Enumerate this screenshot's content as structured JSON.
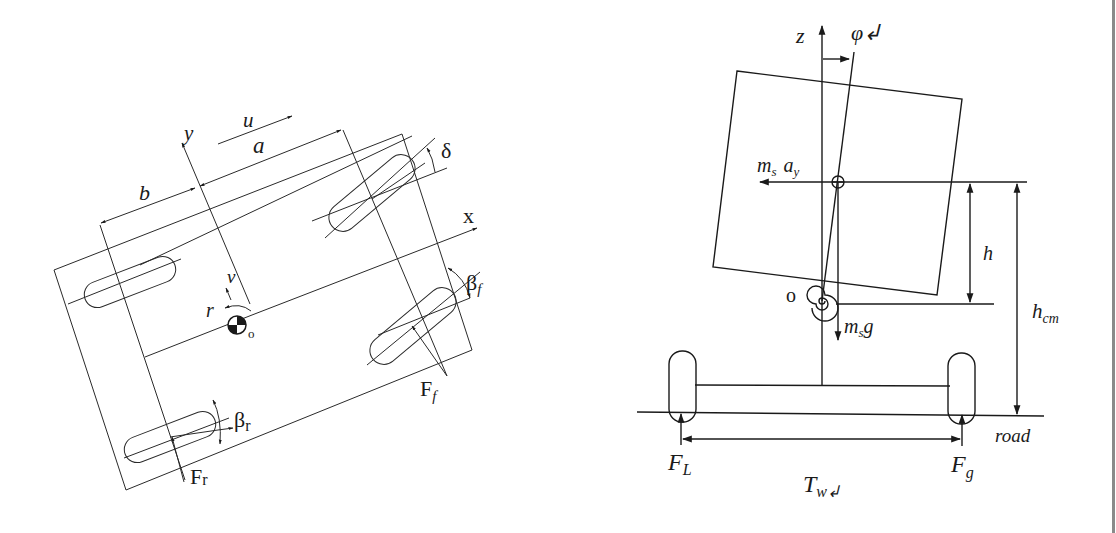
{
  "figure": {
    "left_diagram": {
      "name": "Vehicle planar model (top view)",
      "labels": {
        "y_axis": "y",
        "x_axis": "x",
        "u": "u",
        "a": "a",
        "b": "b",
        "v": "v",
        "r": "r",
        "origin": "o",
        "delta": "δ",
        "beta_f": "β",
        "beta_f_sub": "f",
        "beta_r": "β",
        "beta_r_sub": "r",
        "F_f": "F",
        "F_f_sub": "f",
        "F_r": "F",
        "F_r_sub": "r"
      }
    },
    "right_diagram": {
      "name": "Vehicle roll model (rear view)",
      "labels": {
        "z_axis": "z",
        "phi": "φ↲",
        "ms_ay": "m",
        "ms_ay_sub": "s",
        "ay": "a",
        "ay_sub": "y",
        "h": "h",
        "h_cm": "h",
        "h_cm_sub": "cm",
        "origin": "o",
        "ms_g": "m",
        "ms_g_sub": "s",
        "ms_g_g": "g",
        "road": "road",
        "F_L": "F",
        "F_L_sub": "L",
        "F_g": "F",
        "F_g_sub": "g",
        "T_w": "T",
        "T_w_sub": "w↲"
      }
    },
    "colors": {
      "line": "#2a2a2a",
      "background": "#ffffff",
      "edge_bar": "#8a8a8a"
    }
  }
}
